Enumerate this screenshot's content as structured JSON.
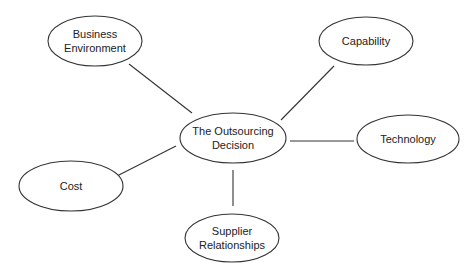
{
  "diagram": {
    "type": "mind-map",
    "center": {
      "id": "outsourcing-decision",
      "lines": [
        "The Outsourcing",
        "Decision"
      ],
      "cx": 233,
      "cy": 138,
      "rx": 53,
      "ry": 25
    },
    "nodes": [
      {
        "id": "business-environment",
        "lines": [
          "Business",
          "Environment"
        ],
        "cx": 95,
        "cy": 41,
        "rx": 47,
        "ry": 25
      },
      {
        "id": "capability",
        "lines": [
          "Capability"
        ],
        "cx": 366,
        "cy": 41,
        "rx": 47,
        "ry": 24
      },
      {
        "id": "technology",
        "lines": [
          "Technology"
        ],
        "cx": 408,
        "cy": 139,
        "rx": 51,
        "ry": 24
      },
      {
        "id": "cost",
        "lines": [
          "Cost"
        ],
        "cx": 71,
        "cy": 186,
        "rx": 52,
        "ry": 25
      },
      {
        "id": "supplier-relationships",
        "lines": [
          "Supplier",
          "Relationships"
        ],
        "cx": 232,
        "cy": 238,
        "rx": 47,
        "ry": 24
      }
    ],
    "edges": [
      {
        "from": "business-environment",
        "to": "outsourcing-decision",
        "x1": 129,
        "y1": 64,
        "x2": 192,
        "y2": 113
      },
      {
        "from": "capability",
        "to": "outsourcing-decision",
        "x1": 334,
        "y1": 66,
        "x2": 281,
        "y2": 120
      },
      {
        "from": "technology",
        "to": "outsourcing-decision",
        "x1": 354,
        "y1": 141,
        "x2": 290,
        "y2": 141
      },
      {
        "from": "cost",
        "to": "outsourcing-decision",
        "x1": 115,
        "y1": 177,
        "x2": 176,
        "y2": 146
      },
      {
        "from": "supplier-relationships",
        "to": "outsourcing-decision",
        "x1": 233,
        "y1": 206,
        "x2": 233,
        "y2": 170
      }
    ],
    "colors": {
      "stroke": "#333333",
      "text": "#222222",
      "fill": "#ffffff",
      "background": "#ffffff"
    }
  }
}
